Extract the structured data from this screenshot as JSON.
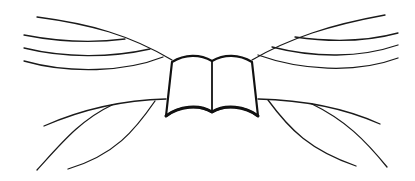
{
  "illustration": {
    "subject": "open book with wing-like flowing lines",
    "line_color": "#1a1a1a",
    "background_color": "#ffffff",
    "icon": "open-book-icon"
  }
}
